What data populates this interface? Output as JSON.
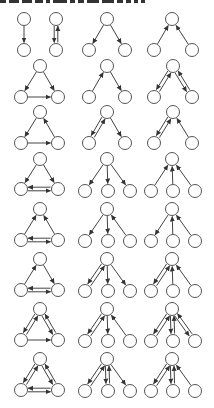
{
  "style": {
    "node_radius": 6.5,
    "node_stroke": "#555555",
    "node_fill": "#ffffff",
    "edge_color": "#444444",
    "mutual_offset": 1.8
  },
  "top_strip": {
    "segments": [
      6,
      10,
      10,
      8,
      4,
      14,
      5,
      6,
      12,
      12,
      6,
      5,
      4,
      4
    ]
  },
  "diagram": {
    "motifs": [
      {
        "id": "r1c1",
        "nodes": [
          [
            24,
            19
          ],
          [
            24,
            50
          ]
        ],
        "edges": [
          [
            0,
            1,
            "d"
          ]
        ]
      },
      {
        "id": "r1c2",
        "nodes": [
          [
            56,
            19
          ],
          [
            56,
            50
          ]
        ],
        "edges": [
          [
            0,
            1,
            "m"
          ]
        ]
      },
      {
        "id": "r1c3",
        "nodes": [
          [
            107,
            19
          ],
          [
            89,
            50
          ],
          [
            125,
            50
          ]
        ],
        "edges": [
          [
            0,
            1,
            "d"
          ],
          [
            0,
            2,
            "d"
          ]
        ]
      },
      {
        "id": "r1c4",
        "nodes": [
          [
            172,
            19
          ],
          [
            154,
            50
          ],
          [
            192,
            50
          ]
        ],
        "edges": [
          [
            1,
            0,
            "d"
          ],
          [
            2,
            0,
            "d"
          ]
        ]
      },
      {
        "id": "r2c1",
        "nodes": [
          [
            40,
            66
          ],
          [
            21,
            97
          ],
          [
            58,
            97
          ]
        ],
        "edges": [
          [
            0,
            1,
            "d"
          ],
          [
            0,
            2,
            "d"
          ],
          [
            1,
            2,
            "d"
          ]
        ]
      },
      {
        "id": "r2c2",
        "nodes": [
          [
            107,
            66
          ],
          [
            89,
            97
          ],
          [
            125,
            97
          ]
        ],
        "edges": [
          [
            1,
            0,
            "d"
          ],
          [
            0,
            2,
            "d"
          ]
        ]
      },
      {
        "id": "r2c3",
        "nodes": [
          [
            173,
            66
          ],
          [
            154,
            97
          ],
          [
            192,
            97
          ]
        ],
        "edges": [
          [
            0,
            1,
            "m"
          ],
          [
            0,
            2,
            "m"
          ]
        ]
      },
      {
        "id": "r3c1",
        "nodes": [
          [
            40,
            112
          ],
          [
            21,
            143
          ],
          [
            58,
            143
          ]
        ],
        "edges": [
          [
            0,
            1,
            "d"
          ],
          [
            2,
            0,
            "d"
          ],
          [
            1,
            2,
            "d"
          ]
        ]
      },
      {
        "id": "r3c2",
        "nodes": [
          [
            107,
            112
          ],
          [
            89,
            143
          ],
          [
            125,
            143
          ]
        ],
        "edges": [
          [
            0,
            1,
            "m"
          ],
          [
            0,
            2,
            "d"
          ]
        ]
      },
      {
        "id": "r3c3",
        "nodes": [
          [
            173,
            112
          ],
          [
            154,
            143
          ],
          [
            192,
            143
          ]
        ],
        "edges": [
          [
            0,
            1,
            "m"
          ],
          [
            2,
            0,
            "d"
          ]
        ]
      },
      {
        "id": "r4c1",
        "nodes": [
          [
            40,
            159
          ],
          [
            21,
            189
          ],
          [
            58,
            189
          ]
        ],
        "edges": [
          [
            0,
            1,
            "d"
          ],
          [
            0,
            2,
            "d"
          ],
          [
            1,
            2,
            "m"
          ]
        ]
      },
      {
        "id": "r4c2",
        "nodes": [
          [
            107,
            159
          ],
          [
            85,
            191
          ],
          [
            108,
            191
          ],
          [
            130,
            191
          ]
        ],
        "edges": [
          [
            0,
            1,
            "d"
          ],
          [
            0,
            2,
            "d"
          ],
          [
            0,
            3,
            "d"
          ]
        ]
      },
      {
        "id": "r4c3",
        "nodes": [
          [
            172,
            159
          ],
          [
            151,
            191
          ],
          [
            173,
            191
          ],
          [
            195,
            191
          ]
        ],
        "edges": [
          [
            1,
            0,
            "d"
          ],
          [
            2,
            0,
            "d"
          ],
          [
            3,
            0,
            "d"
          ]
        ]
      },
      {
        "id": "r5c1",
        "nodes": [
          [
            40,
            209
          ],
          [
            21,
            240
          ],
          [
            58,
            240
          ]
        ],
        "edges": [
          [
            1,
            0,
            "d"
          ],
          [
            2,
            0,
            "d"
          ],
          [
            1,
            2,
            "m"
          ]
        ]
      },
      {
        "id": "r5c2",
        "nodes": [
          [
            107,
            209
          ],
          [
            85,
            241
          ],
          [
            108,
            241
          ],
          [
            130,
            241
          ]
        ],
        "edges": [
          [
            0,
            1,
            "d"
          ],
          [
            0,
            2,
            "d"
          ],
          [
            3,
            0,
            "d"
          ]
        ]
      },
      {
        "id": "r5c3",
        "nodes": [
          [
            172,
            209
          ],
          [
            151,
            241
          ],
          [
            173,
            241
          ],
          [
            195,
            241
          ]
        ],
        "edges": [
          [
            0,
            1,
            "d"
          ],
          [
            2,
            0,
            "d"
          ],
          [
            3,
            0,
            "d"
          ]
        ]
      },
      {
        "id": "r6c1",
        "nodes": [
          [
            40,
            259
          ],
          [
            21,
            290
          ],
          [
            58,
            290
          ]
        ],
        "edges": [
          [
            1,
            0,
            "d"
          ],
          [
            0,
            2,
            "d"
          ],
          [
            1,
            2,
            "m"
          ]
        ]
      },
      {
        "id": "r6c2",
        "nodes": [
          [
            107,
            259
          ],
          [
            85,
            291
          ],
          [
            108,
            291
          ],
          [
            130,
            291
          ]
        ],
        "edges": [
          [
            0,
            1,
            "m"
          ],
          [
            0,
            2,
            "d"
          ],
          [
            0,
            3,
            "d"
          ]
        ]
      },
      {
        "id": "r6c3",
        "nodes": [
          [
            172,
            259
          ],
          [
            151,
            291
          ],
          [
            173,
            291
          ],
          [
            195,
            291
          ]
        ],
        "edges": [
          [
            0,
            1,
            "m"
          ],
          [
            2,
            0,
            "d"
          ],
          [
            3,
            0,
            "d"
          ]
        ]
      },
      {
        "id": "r7c1",
        "nodes": [
          [
            40,
            309
          ],
          [
            21,
            340
          ],
          [
            58,
            340
          ]
        ],
        "edges": [
          [
            0,
            1,
            "m"
          ],
          [
            0,
            2,
            "m"
          ],
          [
            1,
            2,
            "d"
          ]
        ]
      },
      {
        "id": "r7c2",
        "nodes": [
          [
            107,
            309
          ],
          [
            85,
            341
          ],
          [
            108,
            341
          ],
          [
            130,
            341
          ]
        ],
        "edges": [
          [
            0,
            1,
            "m"
          ],
          [
            0,
            2,
            "d"
          ],
          [
            3,
            0,
            "d"
          ]
        ]
      },
      {
        "id": "r7c3",
        "nodes": [
          [
            172,
            309
          ],
          [
            151,
            341
          ],
          [
            173,
            341
          ],
          [
            195,
            341
          ]
        ],
        "edges": [
          [
            0,
            1,
            "m"
          ],
          [
            0,
            2,
            "m"
          ],
          [
            0,
            3,
            "m"
          ]
        ]
      },
      {
        "id": "r8c1",
        "nodes": [
          [
            40,
            359
          ],
          [
            21,
            390
          ],
          [
            58,
            390
          ]
        ],
        "edges": [
          [
            0,
            1,
            "m"
          ],
          [
            0,
            2,
            "m"
          ],
          [
            1,
            2,
            "m"
          ]
        ]
      },
      {
        "id": "r8c2",
        "nodes": [
          [
            107,
            359
          ],
          [
            85,
            391
          ],
          [
            108,
            391
          ],
          [
            130,
            391
          ]
        ],
        "edges": [
          [
            0,
            1,
            "m"
          ],
          [
            0,
            2,
            "m"
          ],
          [
            0,
            3,
            "d"
          ]
        ]
      },
      {
        "id": "r8c3",
        "nodes": [
          [
            172,
            359
          ],
          [
            151,
            391
          ],
          [
            173,
            391
          ],
          [
            195,
            391
          ]
        ],
        "edges": [
          [
            0,
            1,
            "m"
          ],
          [
            0,
            2,
            "m"
          ],
          [
            3,
            0,
            "d"
          ]
        ]
      }
    ]
  }
}
